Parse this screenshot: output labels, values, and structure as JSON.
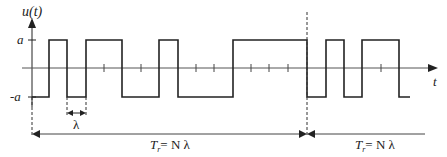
{
  "diagram": {
    "type": "binary pseudo-random waveform",
    "y_axis_label": "u(t)",
    "x_axis_label": "t",
    "level_high_label": "a",
    "level_low_label": "-a",
    "lambda_label": "λ",
    "period_label_1": {
      "T": "T",
      "sub": "r",
      "rest": "= N λ"
    },
    "period_label_2": {
      "T": "T",
      "sub": "r",
      "rest": "= N λ"
    },
    "colors": {
      "line": "#222222",
      "background": "#ffffff"
    },
    "waveform_levels_sequence": [
      "-a",
      "a",
      "-a",
      "a",
      "a",
      "-a",
      "-a",
      "a",
      "-a",
      "-a",
      "-a",
      "a",
      "a",
      "a",
      "a",
      "a",
      "-a",
      "a",
      "-a",
      "a",
      "a",
      "-a"
    ]
  }
}
